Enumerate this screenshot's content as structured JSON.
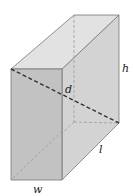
{
  "diagram": {
    "type": "rectangular-prism",
    "labels": {
      "height": "h",
      "diagonal": "d",
      "length": "l",
      "width": "w"
    },
    "colors": {
      "front_face": "#bdbdbd",
      "right_face": "#d3d3d3",
      "top_face": "#e2e2e2",
      "edge": "#777777",
      "diagonal": "#333333",
      "hidden_edge": "#9a9a9a"
    }
  }
}
